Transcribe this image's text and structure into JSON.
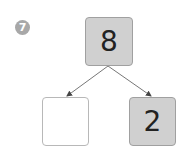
{
  "problem": {
    "number": "7"
  },
  "diagram": {
    "top": {
      "value": "8"
    },
    "left": {
      "value": ""
    },
    "right": {
      "value": "2"
    }
  }
}
